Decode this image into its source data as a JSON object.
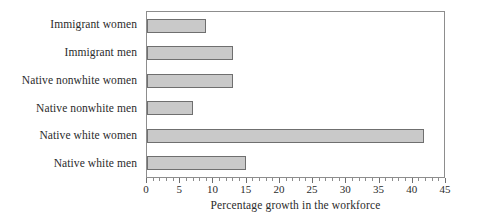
{
  "chart_data": {
    "type": "bar",
    "orientation": "horizontal",
    "title": "",
    "xlabel": "Percentage growth in the workforce",
    "ylabel": "",
    "categories": [
      "Immigrant women",
      "Immigrant men",
      "Native nonwhite women",
      "Native nonwhite men",
      "Native white women",
      "Native white men"
    ],
    "values": [
      9,
      13,
      13,
      7,
      42,
      15
    ],
    "xlim": [
      0,
      45
    ],
    "ylim": null,
    "xticks": [
      0,
      5,
      10,
      15,
      20,
      25,
      30,
      35,
      40,
      45
    ],
    "xticklabels": [
      "0",
      "5",
      "10",
      "15",
      "20",
      "25",
      "30",
      "35",
      "40",
      "45"
    ],
    "minor_tick_interval": 1,
    "grid": false,
    "legend": null,
    "legend_position": "none",
    "bar_fill_color": "#c9c9c9",
    "bar_edge_color": "#6f6f6f",
    "frame_color": "#8d8d8d",
    "background_color": "#ffffff"
  }
}
